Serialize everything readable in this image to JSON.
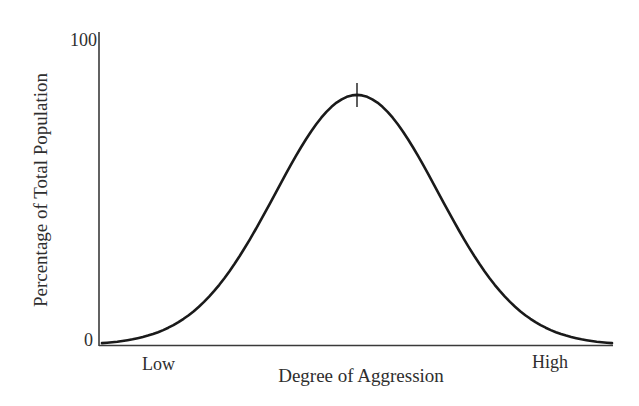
{
  "chart_data": {
    "type": "line",
    "title": "",
    "xlabel": "Degree of Aggression",
    "ylabel": "Percentage of Total Population",
    "y_ticks": [
      "0",
      "100"
    ],
    "ylim": [
      0,
      100
    ],
    "x_tick_labels": [
      "Low",
      "High"
    ],
    "grid": false,
    "legend": null,
    "annotations": [
      "vertical tick mark at curve peak (mean)"
    ],
    "series": [
      {
        "name": "Distribution of aggression",
        "shape": "bell curve (normal distribution)",
        "x": [
          0,
          5,
          10,
          15,
          20,
          25,
          30,
          35,
          40,
          45,
          50,
          55,
          60,
          65,
          70,
          75,
          80,
          85,
          90,
          95,
          100
        ],
        "values": [
          0,
          1,
          3,
          6,
          11,
          18,
          26,
          37,
          52,
          68,
          82,
          68,
          52,
          37,
          26,
          18,
          11,
          6,
          3,
          1,
          0
        ],
        "peak": {
          "x": 50,
          "y": 82
        }
      }
    ]
  },
  "labels": {
    "y_axis": "Percentage of Total Population",
    "x_axis": "Degree of Aggression",
    "y_max": "100",
    "y_min": "0",
    "x_low": "Low",
    "x_high": "High"
  },
  "colors": {
    "line": "#1a1a1a",
    "axis": "#3a3a3a",
    "text": "#2e2e2e",
    "background": "#ffffff"
  }
}
